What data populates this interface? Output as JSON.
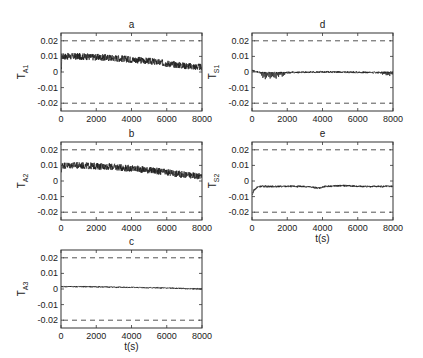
{
  "chart_data": [
    {
      "id": "a",
      "type": "line",
      "title": "a",
      "ylabel": "T",
      "ylabel_sub": "A1",
      "xlabel": "",
      "xlim": [
        0,
        8000
      ],
      "ylim": [
        -0.025,
        0.025
      ],
      "xticks": [
        0,
        2000,
        4000,
        6000,
        8000
      ],
      "yticks": [
        0.02,
        0.01,
        0,
        -0.01,
        -0.02
      ],
      "ytick_labels": [
        "0.02",
        "0.01",
        "0",
        "-0.01",
        "-0.02"
      ],
      "bounds": [
        0.02,
        -0.02
      ],
      "series": [
        {
          "name": "T_A1",
          "x": [
            0,
            1000,
            2000,
            3000,
            4000,
            5000,
            6000,
            7000,
            8000
          ],
          "values": [
            0.01,
            0.01,
            0.0095,
            0.009,
            0.008,
            0.007,
            0.0055,
            0.004,
            0.003
          ],
          "noise_amplitude": 0.0022,
          "initial_transient": -0.002
        }
      ]
    },
    {
      "id": "b",
      "type": "line",
      "title": "b",
      "ylabel": "T",
      "ylabel_sub": "A2",
      "xlabel": "",
      "xlim": [
        0,
        8000
      ],
      "ylim": [
        -0.025,
        0.025
      ],
      "xticks": [
        0,
        2000,
        4000,
        6000,
        8000
      ],
      "yticks": [
        0.02,
        0.01,
        0,
        -0.01,
        -0.02
      ],
      "ytick_labels": [
        "0.02",
        "0.01",
        "0",
        "-0.01",
        "-0.02"
      ],
      "bounds": [
        0.02,
        -0.02
      ],
      "series": [
        {
          "name": "T_A2",
          "x": [
            0,
            1000,
            2000,
            3000,
            4000,
            5000,
            6000,
            7000,
            8000
          ],
          "values": [
            0.01,
            0.01,
            0.0095,
            0.009,
            0.008,
            0.007,
            0.0055,
            0.004,
            0.003
          ],
          "noise_amplitude": 0.0022,
          "initial_transient": 0.005
        }
      ]
    },
    {
      "id": "c",
      "type": "line",
      "title": "c",
      "ylabel": "T",
      "ylabel_sub": "A3",
      "xlabel": "t(s)",
      "xlim": [
        0,
        8000
      ],
      "ylim": [
        -0.025,
        0.025
      ],
      "xticks": [
        0,
        2000,
        4000,
        6000,
        8000
      ],
      "yticks": [
        0.02,
        0.01,
        0,
        -0.01,
        -0.02
      ],
      "ytick_labels": [
        "0.02",
        "0.01",
        "0",
        "-0.01",
        "-0.02"
      ],
      "bounds": [
        0.02,
        -0.02
      ],
      "series": [
        {
          "name": "T_A3",
          "x": [
            0,
            1000,
            2000,
            3000,
            4000,
            5000,
            6000,
            7000,
            8000
          ],
          "values": [
            0.0015,
            0.0015,
            0.0014,
            0.0012,
            0.001,
            0.0008,
            0.0006,
            0.0003,
            0.0
          ],
          "noise_amplitude": 0.0004,
          "initial_transient": 0.0015
        }
      ]
    },
    {
      "id": "d",
      "type": "line",
      "title": "d",
      "ylabel": "T",
      "ylabel_sub": "S1",
      "xlabel": "",
      "xlim": [
        0,
        8000
      ],
      "ylim": [
        -0.025,
        0.025
      ],
      "xticks": [
        0,
        2000,
        4000,
        6000,
        8000
      ],
      "yticks": [
        0.02,
        0.01,
        0,
        -0.01,
        -0.02
      ],
      "ytick_labels": [
        "0.02",
        "0.01",
        "0",
        "-0.01",
        "-0.02"
      ],
      "bounds": [
        0.02,
        -0.02
      ],
      "series": [
        {
          "name": "T_S1",
          "x": [
            0,
            500,
            1000,
            2000,
            3000,
            4000,
            5000,
            6000,
            7000,
            8000
          ],
          "values": [
            0.001,
            -0.0005,
            -0.0005,
            -0.0003,
            -0.0002,
            0.0,
            0.0,
            -0.0002,
            -0.0003,
            -0.0004
          ],
          "noise_amplitude": 0.0006,
          "initial_transient": 0.001,
          "spikes": [
            {
              "from": 500,
              "to": 1900,
              "depth": -0.004
            },
            {
              "from": 7400,
              "to": 8000,
              "depth": -0.002
            }
          ]
        }
      ]
    },
    {
      "id": "e",
      "type": "line",
      "title": "e",
      "ylabel": "T",
      "ylabel_sub": "S2",
      "xlabel": "t(s)",
      "xlim": [
        0,
        8000
      ],
      "ylim": [
        -0.025,
        0.025
      ],
      "xticks": [
        0,
        2000,
        4000,
        6000,
        8000
      ],
      "yticks": [
        0.02,
        0.01,
        0,
        -0.01,
        -0.02
      ],
      "ytick_labels": [
        "0.02",
        "0.01",
        "0",
        "-0.01",
        "-0.02"
      ],
      "bounds": [
        0.02,
        -0.02
      ],
      "series": [
        {
          "name": "T_S2",
          "x": [
            0,
            100,
            300,
            500,
            1000,
            2000,
            3000,
            3800,
            4200,
            5000,
            5500,
            6000,
            7000,
            8000
          ],
          "values": [
            -0.009,
            -0.006,
            -0.004,
            -0.0035,
            -0.0035,
            -0.0035,
            -0.0035,
            -0.0045,
            -0.0035,
            -0.003,
            -0.003,
            -0.0035,
            -0.0035,
            -0.0035
          ],
          "noise_amplitude": 0.0006,
          "initial_transient": -0.009
        }
      ]
    }
  ],
  "layout": {
    "panels": {
      "a": {
        "left": 61,
        "top": 33,
        "width": 141,
        "height": 78
      },
      "b": {
        "left": 61,
        "top": 142,
        "width": 141,
        "height": 78
      },
      "c": {
        "left": 61,
        "top": 250,
        "width": 141,
        "height": 78
      },
      "d": {
        "left": 252,
        "top": 33,
        "width": 141,
        "height": 78
      },
      "e": {
        "left": 252,
        "top": 142,
        "width": 141,
        "height": 78
      }
    },
    "colors": {
      "trace": "#1c1c1c",
      "bounds": "#555555",
      "axes": "#333333",
      "text": "#222222"
    }
  }
}
